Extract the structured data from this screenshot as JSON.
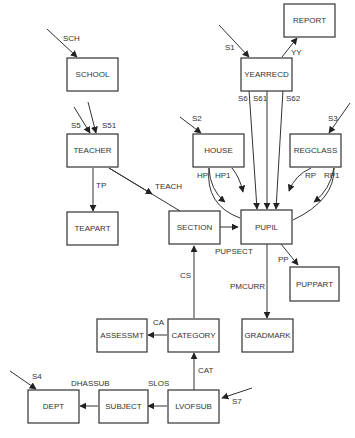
{
  "diagram": {
    "type": "data-structure-diagram",
    "records": {
      "report": "REPORT",
      "school": "SCHOOL",
      "yearrecd": "YEARRECD",
      "teacher": "TEACHER",
      "house": "HOUSE",
      "regclass": "REGCLASS",
      "teapart": "TEAPART",
      "section": "SECTION",
      "pupil": "PUPIL",
      "puppart": "PUPPART",
      "assessmt": "ASSESSMT",
      "category": "CATEGORY",
      "gradmark": "GRADMARK",
      "dept": "DEPT",
      "subject": "SUBJECT",
      "lvofsub": "LVOFSUB"
    },
    "sets": {
      "sch": "SCH",
      "s1": "S1",
      "yy": "YY",
      "s5": "S5",
      "s51": "S51",
      "s6": "S6",
      "s61": "S61",
      "s62": "S62",
      "s2": "S2",
      "s3": "S3",
      "tp": "TP",
      "teach": "TEACH",
      "hp": "HP",
      "hp1": "HP1",
      "rp": "RP",
      "rp1": "RP1",
      "pupsect": "PUPSECT",
      "pp": "PP",
      "cs": "CS",
      "pmcurr": "PMCURR",
      "ca": "CA",
      "cat": "CAT",
      "s4": "S4",
      "dhassub": "DHASSUB",
      "slos": "SLOS",
      "s7": "S7"
    }
  }
}
